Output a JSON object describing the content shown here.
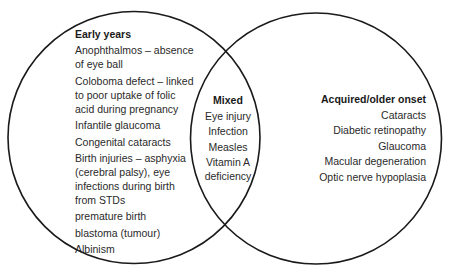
{
  "diagram": {
    "type": "venn",
    "sets": [
      {
        "title": "Early years",
        "items": [
          [
            "Anophthalmos – absence",
            "of eye ball"
          ],
          [
            "Coloboma defect – linked",
            "to poor uptake of folic",
            "acid during pregnancy"
          ],
          [
            "Infantile glaucoma"
          ],
          [
            "Congenital cataracts"
          ],
          [
            "Birth injuries – asphyxia",
            "(cerebral palsy), eye",
            "infections during birth",
            "from STDs"
          ],
          [
            "premature birth"
          ],
          [
            "blastoma (tumour)"
          ],
          [
            "Albinism"
          ]
        ]
      },
      {
        "title": "Mixed",
        "items": [
          [
            "Eye injury"
          ],
          [
            "Infection"
          ],
          [
            "Measles"
          ],
          [
            "Vitamin A",
            "deficiency"
          ]
        ]
      },
      {
        "title": "Acquired/older onset",
        "items": [
          [
            "Cataracts"
          ],
          [
            "Diabetic retinopathy"
          ],
          [
            "Glaucoma"
          ],
          [
            "Macular degeneration"
          ],
          [
            "Optic nerve hypoplasia"
          ]
        ]
      }
    ],
    "colors": {
      "stroke": "#1a1a1a",
      "background": "#ffffff",
      "text": "#2a2a2a"
    }
  }
}
